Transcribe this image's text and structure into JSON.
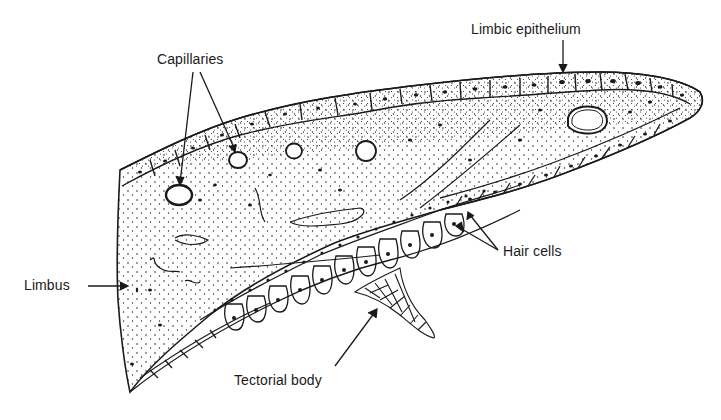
{
  "figure": {
    "ink_color": "#1a1a1a",
    "background": "#ffffff"
  },
  "labels": {
    "limbic_epithelium": "Limbic epithelium",
    "capillaries": "Capillaries",
    "limbus": "Limbus",
    "hair_cells": "Hair cells",
    "tectorial_body": "Tectorial body"
  }
}
